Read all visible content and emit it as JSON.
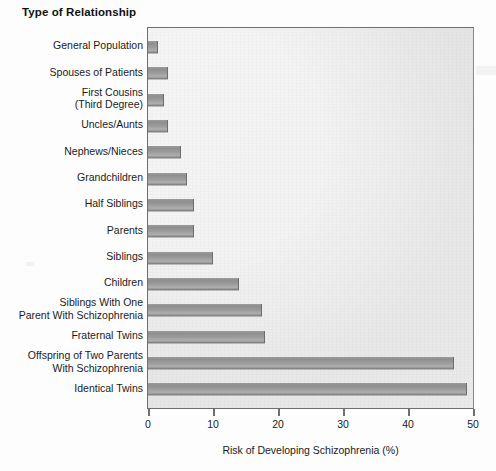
{
  "chart_data": {
    "type": "bar",
    "orientation": "horizontal",
    "title": "Type of Relationship",
    "xlabel": "Risk of Developing Schizophrenia (%)",
    "ylabel": "Type of Relationship",
    "xlim": [
      0,
      50
    ],
    "xticks": [
      0,
      10,
      20,
      30,
      40,
      50
    ],
    "xtick_labels": [
      "0",
      "10",
      "20",
      "30",
      "40",
      "50"
    ],
    "grid": false,
    "legend": null,
    "categories": [
      "General Population",
      "Spouses of Patients",
      "First Cousins\n(Third Degree)",
      "Uncles/Aunts",
      "Nephews/Nieces",
      "Grandchildren",
      "Half Siblings",
      "Parents",
      "Siblings",
      "Children",
      "Siblings With One\nParent With Schizophrenia",
      "Fraternal Twins",
      "Offspring of Two Parents\nWith Schizophrenia",
      "Identical Twins"
    ],
    "values": [
      1.5,
      3,
      2.5,
      3,
      5,
      6,
      7,
      7,
      10,
      14,
      17.5,
      18,
      47,
      49
    ]
  },
  "colors": {
    "bar_fill": "#9a9a9a",
    "bar_edge": "#6d6d6d",
    "plot_background": "#e7e7e7",
    "axis": "#6f6f6f",
    "text": "#1b1b1b",
    "page_background": "#fdfdfd"
  }
}
